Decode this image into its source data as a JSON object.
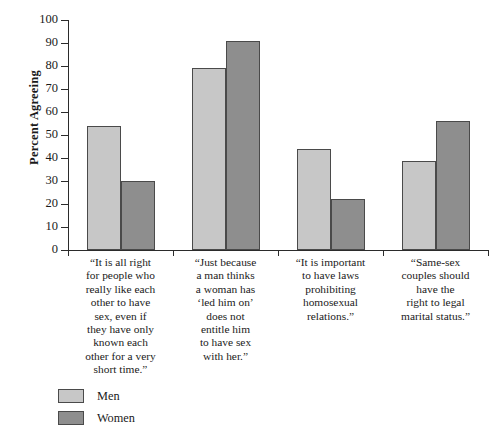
{
  "chart_data": {
    "type": "bar",
    "title": "",
    "xlabel": "",
    "ylabel": "Percent Agreeing",
    "ylim": [
      0,
      100
    ],
    "yticks": [
      0,
      10,
      20,
      30,
      40,
      50,
      60,
      70,
      80,
      90,
      100
    ],
    "grid": false,
    "legend_position": "bottom-left",
    "categories": [
      "“It is all right\nfor people who\nreally like each\nother to have\nsex, even if\nthey have only\nknown each\nother for a very\nshort time.”",
      "“Just because\na man thinks\na woman has\n‘led him on’\ndoes not\nentitle him\nto have sex\nwith her.”",
      "“It is important\nto have laws\nprohibiting\nhomosexual\nrelations.”",
      "“Same-sex\ncouples should\nhave the\nright to legal\nmarital status.”"
    ],
    "series": [
      {
        "name": "Men",
        "color": "#c7c7c7",
        "values": [
          54,
          79,
          44,
          38.5
        ]
      },
      {
        "name": "Women",
        "color": "#8e8e8e",
        "values": [
          30,
          91,
          22,
          56
        ]
      }
    ]
  },
  "legend": {
    "items": [
      {
        "label": "Men"
      },
      {
        "label": "Women"
      }
    ]
  }
}
